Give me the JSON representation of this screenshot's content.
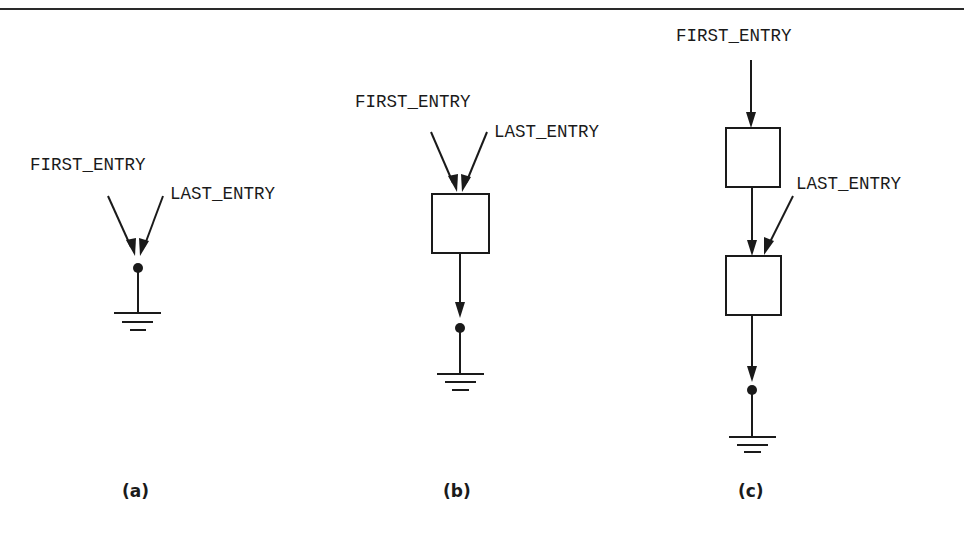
{
  "figure": {
    "panels": [
      {
        "id": "a",
        "caption": "(a)",
        "first_entry_label": "FIRST_ENTRY",
        "last_entry_label": "LAST_ENTRY",
        "node_count": 0,
        "description": "Empty list: both pointers point to the null/ground terminator"
      },
      {
        "id": "b",
        "caption": "(b)",
        "first_entry_label": "FIRST_ENTRY",
        "last_entry_label": "LAST_ENTRY",
        "node_count": 1,
        "description": "One-entry list: both pointers point to the single node, which links to the terminator"
      },
      {
        "id": "c",
        "caption": "(c)",
        "first_entry_label": "FIRST_ENTRY",
        "last_entry_label": "LAST_ENTRY",
        "node_count": 2,
        "description": "Two-entry list: FIRST_ENTRY points to first node, LAST_ENTRY points to second node, which links to the terminator"
      }
    ],
    "colors": {
      "ink": "#1a1a1a",
      "background": "#ffffff"
    }
  }
}
